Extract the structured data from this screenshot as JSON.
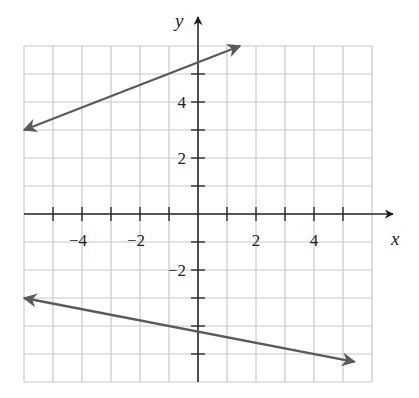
{
  "chart_data": {
    "type": "line",
    "title": "",
    "xlabel": "x",
    "ylabel": "y",
    "xlim": [
      -6,
      6
    ],
    "ylim": [
      -6,
      6
    ],
    "grid": true,
    "grid_step": 1,
    "x_tick_labels": [
      {
        "value": -4,
        "text": "−4"
      },
      {
        "value": -2,
        "text": "−2"
      },
      {
        "value": 2,
        "text": "2"
      },
      {
        "value": 4,
        "text": "4"
      }
    ],
    "y_tick_labels": [
      {
        "value": 4,
        "text": "4"
      },
      {
        "value": 2,
        "text": "2"
      },
      {
        "value": -2,
        "text": "−2"
      }
    ],
    "series": [
      {
        "name": "upper line",
        "slope": 0.4,
        "intercept": 5.4,
        "points": [
          {
            "x": -6,
            "y": 3
          },
          {
            "x": 1.45,
            "y": 6
          }
        ],
        "arrows": "both",
        "color": "#5a5a5a"
      },
      {
        "name": "lower line",
        "slope": -0.2,
        "intercept": -4.2,
        "points": [
          {
            "x": -6,
            "y": -3
          },
          {
            "x": 5.4,
            "y": -5.28
          }
        ],
        "arrows": "both",
        "color": "#5a5a5a"
      }
    ],
    "legend": null
  },
  "labels": {
    "x_axis": "x",
    "y_axis": "y"
  },
  "colors": {
    "grid": "#c9c9c9",
    "axis": "#2a2a2a",
    "lines": "#5a5a5a",
    "background": "#ffffff"
  }
}
